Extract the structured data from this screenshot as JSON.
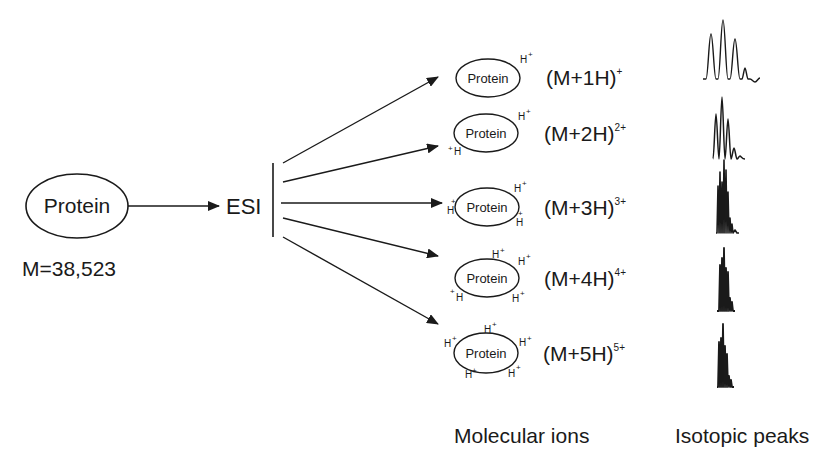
{
  "source": {
    "label": "Protein",
    "mass_label": "M=38,523"
  },
  "process": {
    "label": "ESI"
  },
  "ions": [
    {
      "protein_label": "Protein",
      "formula": "(M+1H)",
      "charge": "+",
      "protons": 1
    },
    {
      "protein_label": "Protein",
      "formula": "(M+2H)",
      "charge": "2+",
      "protons": 2
    },
    {
      "protein_label": "Protein",
      "formula": "(M+3H)",
      "charge": "3+",
      "protons": 3
    },
    {
      "protein_label": "Protein",
      "formula": "(M+4H)",
      "charge": "4+",
      "protons": 4
    },
    {
      "protein_label": "Protein",
      "formula": "(M+5H)",
      "charge": "5+",
      "protons": 5
    }
  ],
  "proton_glyph": {
    "h": "H",
    "plus": "+"
  },
  "footer": {
    "molecular_ions_label": "Molecular ions",
    "isotopic_peaks_label": "Isotopic peaks"
  },
  "colors": {
    "ink": "#1a1a1a",
    "background": "#ffffff"
  }
}
